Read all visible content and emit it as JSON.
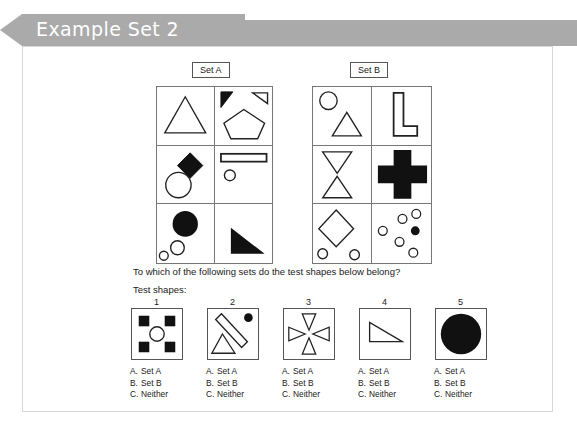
{
  "banner": {
    "title": "Example Set 2",
    "bg_color": "#aaaaaa",
    "text_color": "#ffffff"
  },
  "sets": [
    {
      "label": "Set A",
      "cells": [
        "white-triangle",
        "black-right-triangle-and-white-right-triangle-and-pentagon",
        "black-diamond-and-white-circle",
        "white-rectangle-bar-and-small-circle",
        "large-black-circle-and-two-small-white-circles",
        "black-right-triangle"
      ]
    },
    {
      "label": "Set B",
      "cells": [
        "white-circle-and-white-triangle",
        "white-l-shape",
        "white-down-triangle-and-white-up-triangle",
        "black-cross",
        "white-diamond-and-two-small-circles",
        "six-white-circles-and-one-black-circle"
      ]
    }
  ],
  "question": "To which of the following sets do the test shapes below belong?",
  "test_shapes_label": "Test shapes:",
  "test_shapes": [
    {
      "number": "1",
      "figure": "four-black-squares-and-center-circle"
    },
    {
      "number": "2",
      "figure": "diagonal-bar-black-dot-and-triangle"
    },
    {
      "number": "3",
      "figure": "four-inward-triangles-cross"
    },
    {
      "number": "4",
      "figure": "white-right-triangle"
    },
    {
      "number": "5",
      "figure": "large-black-circle"
    }
  ],
  "options": [
    {
      "key": "A.",
      "value": "Set A"
    },
    {
      "key": "B.",
      "value": "Set B"
    },
    {
      "key": "C.",
      "value": "Neither"
    }
  ],
  "colors": {
    "fill_black": "#111111",
    "stroke": "#222222",
    "grid_line": "#777777",
    "panel_border": "#d8d8d8"
  }
}
